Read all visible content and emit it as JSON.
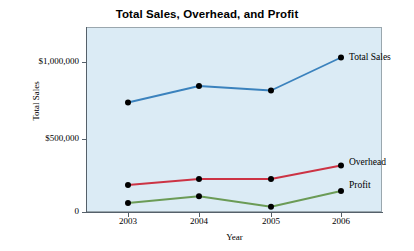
{
  "chart_data": {
    "type": "line",
    "title": "Total Sales, Overhead, and Profit",
    "xlabel": "Year",
    "ylabel": "Total Sales",
    "categories": [
      "2003",
      "2004",
      "2005",
      "2006"
    ],
    "x": [
      2003,
      2004,
      2005,
      2006
    ],
    "ylim": [
      0,
      1200000
    ],
    "yticks": [
      0,
      500000,
      1000000
    ],
    "ytick_labels": [
      "0",
      "$500,000",
      "$1,000,000"
    ],
    "xtick_labels": [
      "2003",
      "2004",
      "2005",
      "2006"
    ],
    "grid": false,
    "legend_position": "right-of-line-ends",
    "plot_background_color": "#dbebf5",
    "series": [
      {
        "name": "Total Sales",
        "color": "#3b82bd",
        "marker": "circle",
        "marker_color": "#000000",
        "values": [
          730000,
          840000,
          810000,
          1030000
        ]
      },
      {
        "name": "Overhead",
        "color": "#cc3344",
        "marker": "circle",
        "marker_color": "#000000",
        "values": [
          180000,
          220000,
          220000,
          310000
        ]
      },
      {
        "name": "Profit",
        "color": "#6b9b56",
        "marker": "circle",
        "marker_color": "#000000",
        "values": [
          60000,
          105000,
          35000,
          140000
        ]
      }
    ]
  },
  "labels": {
    "title": "Total Sales, Overhead, and Profit",
    "x_axis_title": "Year",
    "y_axis_title": "Total Sales",
    "ytick_0": "0",
    "ytick_1": "$500,000",
    "ytick_2": "$1,000,000",
    "xtick_0": "2003",
    "xtick_1": "2004",
    "xtick_2": "2005",
    "xtick_3": "2006",
    "series_0": "Total Sales",
    "series_1": "Overhead",
    "series_2": "Profit"
  }
}
